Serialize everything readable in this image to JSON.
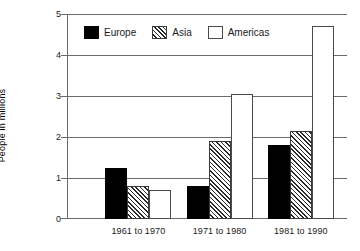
{
  "chart_data": {
    "type": "bar",
    "title": "",
    "subtitle": "",
    "xlabel": "",
    "ylabel": "People in millions",
    "categories": [
      "1961 to 1970",
      "1971 to 1980",
      "1981 to 1990"
    ],
    "series": [
      {
        "name": "Europe",
        "values": [
          1.25,
          0.8,
          1.8
        ],
        "color": "#000000",
        "fill": "solid"
      },
      {
        "name": "Asia",
        "values": [
          0.8,
          1.9,
          2.15
        ],
        "color": "#2b2b2b",
        "fill": "diagonal-hatch"
      },
      {
        "name": "Americas",
        "values": [
          0.7,
          3.05,
          4.7
        ],
        "color": "#ffffff",
        "fill": "outline"
      }
    ],
    "ylim": [
      0,
      5
    ],
    "yticks": [
      0,
      1,
      2,
      3,
      4,
      5
    ],
    "ytick_labels": [
      "0",
      "1",
      "2",
      "3",
      "4",
      "5"
    ],
    "grid": true,
    "grid_axis": "y",
    "legend_position": "top-left-inside",
    "annotations": []
  },
  "legend": {
    "items": [
      {
        "label": "Europe"
      },
      {
        "label": "Asia"
      },
      {
        "label": "Americas"
      }
    ]
  },
  "axes": {
    "y_title": "People in millions",
    "y_tick_labels": [
      "5",
      "4",
      "3",
      "2",
      "1",
      "0"
    ],
    "x_tick_labels": [
      "1961 to 1970",
      "1971 to 1980",
      "1981 to 1990"
    ]
  }
}
